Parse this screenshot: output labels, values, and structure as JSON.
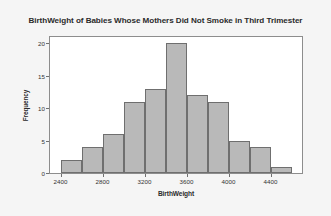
{
  "chart_data": {
    "type": "bar",
    "title": "BirthWeight of Babies Whose Mothers Did Not Smoke in Third Trimester",
    "xlabel": "BirthWeight",
    "ylabel": "Frequency",
    "grid": false,
    "legend": null,
    "xlim": [
      2300,
      4700
    ],
    "ylim": [
      0,
      21
    ],
    "bin_width": 200,
    "xticks": [
      2400,
      2800,
      3200,
      3600,
      4000,
      4400
    ],
    "xtick_labels": [
      "2400",
      "2800",
      "3200",
      "3600",
      "4000",
      "4400"
    ],
    "yticks": [
      0,
      5,
      10,
      15,
      20
    ],
    "ytick_labels": [
      "0",
      "5",
      "10",
      "15",
      "20"
    ],
    "bins": [
      {
        "left": 2400,
        "right": 2600,
        "value": 2
      },
      {
        "left": 2600,
        "right": 2800,
        "value": 4
      },
      {
        "left": 2800,
        "right": 3000,
        "value": 6
      },
      {
        "left": 3000,
        "right": 3200,
        "value": 11
      },
      {
        "left": 3200,
        "right": 3400,
        "value": 13
      },
      {
        "left": 3400,
        "right": 3600,
        "value": 20
      },
      {
        "left": 3600,
        "right": 3800,
        "value": 12
      },
      {
        "left": 3800,
        "right": 4000,
        "value": 11
      },
      {
        "left": 4000,
        "right": 4200,
        "value": 5
      },
      {
        "left": 4200,
        "right": 4400,
        "value": 4
      },
      {
        "left": 4400,
        "right": 4600,
        "value": 1
      }
    ],
    "categories": [
      "2400-2600",
      "2600-2800",
      "2800-3000",
      "3000-3200",
      "3200-3400",
      "3400-3600",
      "3600-3800",
      "3800-4000",
      "4000-4200",
      "4200-4400",
      "4400-4600"
    ],
    "values": [
      2,
      4,
      6,
      11,
      13,
      20,
      12,
      11,
      5,
      4,
      1
    ],
    "colors": {
      "bar_fill": "#b9b9b9",
      "bar_edge": "#6f6f6f",
      "plot_background": "#ffffff",
      "figure_background": "#f5f5f5",
      "text": "#2b2b2b"
    }
  }
}
